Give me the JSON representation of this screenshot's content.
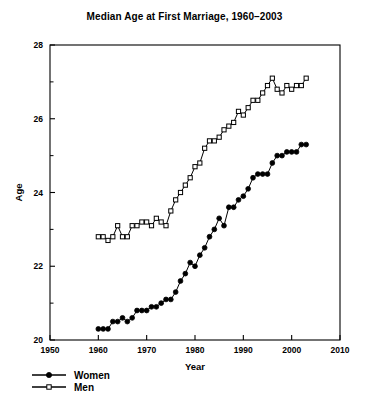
{
  "chart_data": {
    "type": "line",
    "title": "Median Age at First Marriage, 1960–2003",
    "xlabel": "Year",
    "ylabel": "Age",
    "xlim": [
      1950,
      2010
    ],
    "ylim": [
      20,
      28
    ],
    "xticks": [
      1950,
      1960,
      1970,
      1980,
      1990,
      2000,
      2010
    ],
    "xtick_labels": [
      "1950",
      "1960",
      "1970",
      "1980",
      "1990",
      "2000",
      "2010"
    ],
    "yticks": [
      20,
      22,
      24,
      26,
      28
    ],
    "ytick_labels": [
      "20",
      "22",
      "24",
      "26",
      "28"
    ],
    "yminor_ticks": [
      21,
      23,
      25,
      27
    ],
    "grid": false,
    "legend_position": "below-left",
    "x": [
      1960,
      1961,
      1962,
      1963,
      1964,
      1965,
      1966,
      1967,
      1968,
      1969,
      1970,
      1971,
      1972,
      1973,
      1974,
      1975,
      1976,
      1977,
      1978,
      1979,
      1980,
      1981,
      1982,
      1983,
      1984,
      1985,
      1986,
      1987,
      1988,
      1989,
      1990,
      1991,
      1992,
      1993,
      1994,
      1995,
      1996,
      1997,
      1998,
      1999,
      2000,
      2001,
      2002,
      2003
    ],
    "series": [
      {
        "name": "Women",
        "marker": "filled-circle",
        "values": [
          20.3,
          20.3,
          20.3,
          20.5,
          20.5,
          20.6,
          20.5,
          20.6,
          20.8,
          20.8,
          20.8,
          20.9,
          20.9,
          21.0,
          21.1,
          21.1,
          21.3,
          21.6,
          21.8,
          22.1,
          22.0,
          22.3,
          22.5,
          22.8,
          23.0,
          23.3,
          23.1,
          23.6,
          23.6,
          23.8,
          23.9,
          24.1,
          24.4,
          24.5,
          24.5,
          24.5,
          24.8,
          25.0,
          25.0,
          25.1,
          25.1,
          25.1,
          25.3,
          25.3
        ]
      },
      {
        "name": "Men",
        "marker": "open-square",
        "values": [
          22.8,
          22.8,
          22.7,
          22.8,
          23.1,
          22.8,
          22.8,
          23.1,
          23.1,
          23.2,
          23.2,
          23.1,
          23.3,
          23.2,
          23.1,
          23.5,
          23.8,
          24.0,
          24.2,
          24.4,
          24.7,
          24.8,
          25.2,
          25.4,
          25.4,
          25.5,
          25.7,
          25.8,
          25.9,
          26.2,
          26.1,
          26.3,
          26.5,
          26.5,
          26.7,
          26.9,
          27.1,
          26.8,
          26.7,
          26.9,
          26.8,
          26.9,
          26.9,
          27.1
        ]
      }
    ],
    "legend": [
      {
        "label": "Women",
        "marker": "filled-circle"
      },
      {
        "label": "Men",
        "marker": "open-square"
      }
    ]
  }
}
